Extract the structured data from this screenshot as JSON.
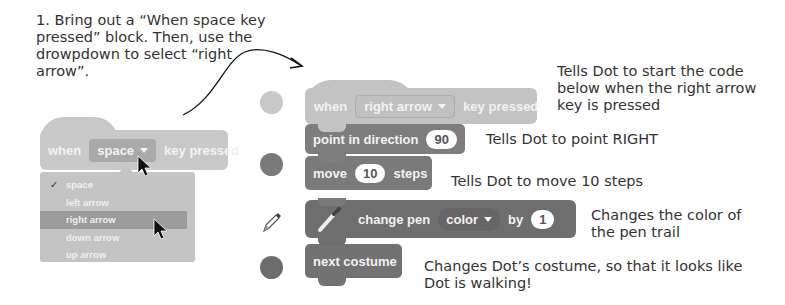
{
  "instruction": {
    "text": "1. Bring out a “When space key pressed” block. Then, use the drowpdown to select “right arrow”."
  },
  "left_example": {
    "hat_block": {
      "when": "when",
      "dropdown_value": "space",
      "suffix": "key pressed"
    },
    "dropdown_menu": {
      "checkmark": "✓",
      "options": [
        "space",
        "left arrow",
        "right arrow",
        "down arrow",
        "up arrow"
      ],
      "checked": "space",
      "highlighted": "right arrow"
    }
  },
  "script": {
    "hat": {
      "when": "when",
      "dropdown_value": "right arrow",
      "suffix": "key pressed",
      "color": "#c3c3c3"
    },
    "point": {
      "label": "point in direction",
      "value": "90",
      "color": "#7d7d7d"
    },
    "move": {
      "label": "move",
      "value": "10",
      "suffix": "steps",
      "color": "#7a7a7a"
    },
    "pen": {
      "label": "change pen",
      "dropdown_value": "color",
      "by": "by",
      "value": "1",
      "color": "#6e6e6e"
    },
    "costume": {
      "label": "next costume",
      "color": "#727272"
    }
  },
  "category_icons": [
    {
      "name": "events",
      "color": "#c8c8c8"
    },
    {
      "name": "motion",
      "color": "#7a7a7a"
    },
    {
      "name": "pen",
      "icon": "pencil"
    },
    {
      "name": "looks",
      "color": "#6c6c6c"
    }
  ],
  "notes": {
    "hat": "Tells Dot to start the code below when the right arrow key is pressed",
    "point": "Tells Dot to point RIGHT",
    "move": "Tells Dot to move 10 steps",
    "pen": "Changes the color of the pen trail",
    "costume": "Changes Dot’s costume, so that it looks like Dot is walking!"
  }
}
